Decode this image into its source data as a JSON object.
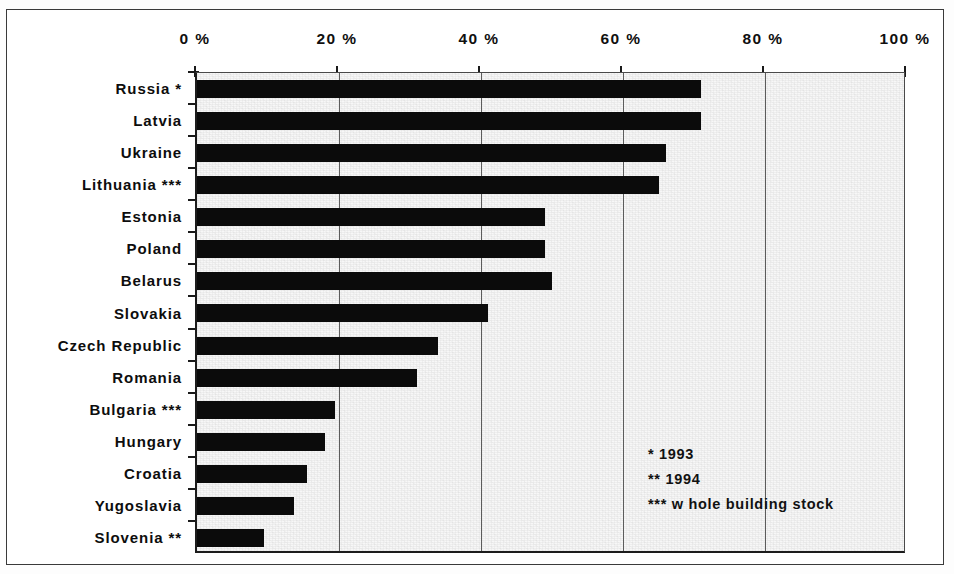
{
  "chart_data": {
    "type": "bar",
    "orientation": "horizontal",
    "title": "",
    "xlabel": "",
    "ylabel": "",
    "xlim": [
      0,
      100
    ],
    "grid": true,
    "legend": null,
    "categories": [
      "Russia *",
      "Latvia",
      "Ukraine",
      "Lithuania ***",
      "Estonia",
      "Poland",
      "Belarus",
      "Slovakia",
      "Czech Republic",
      "Romania",
      "Bulgaria ***",
      "Hungary",
      "Croatia",
      "Yugoslavia",
      "Slovenia **"
    ],
    "values": [
      71,
      71,
      66,
      65,
      49,
      49,
      50,
      41,
      34,
      31,
      19.5,
      18,
      15.5,
      13.7,
      9.5
    ],
    "x_tick_labels": [
      "0 %",
      "20 %",
      "40 %",
      "60 %",
      "80 %",
      "100 %"
    ],
    "x_tick_values": [
      0,
      20,
      40,
      60,
      80,
      100
    ],
    "bar_color": "#0b0b0b",
    "plot_background": "#f7f7f7",
    "annotations": [
      "* 1993",
      "** 1994",
      "*** w hole building stock"
    ]
  }
}
